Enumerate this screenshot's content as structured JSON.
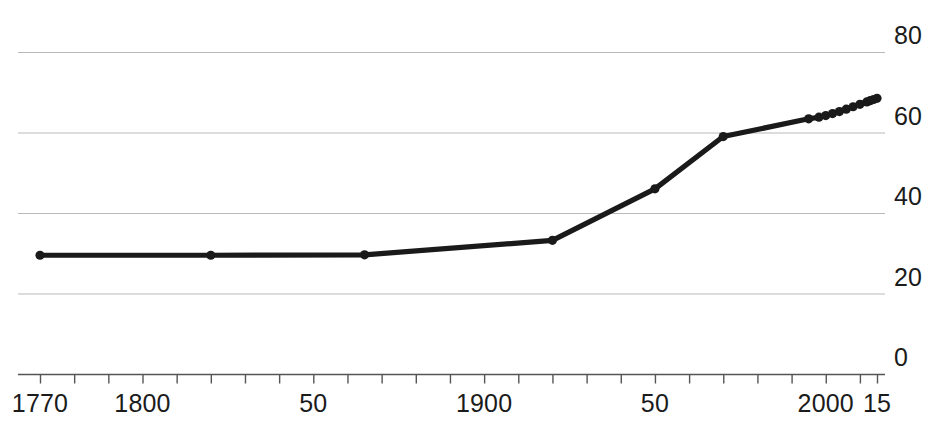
{
  "chart_data": {
    "type": "line",
    "title": "",
    "subtitle": "",
    "xlabel": "",
    "ylabel": "",
    "xlim": [
      1765,
      2019
    ],
    "ylim": [
      0,
      86
    ],
    "grid": true,
    "grid_axis": "y",
    "legend": "none",
    "y_axis_position": "right",
    "x_tick_interval_years": 10,
    "y_ticks": [
      {
        "value": 80,
        "label": "80"
      },
      {
        "value": 60,
        "label": "60"
      },
      {
        "value": 40,
        "label": "40"
      },
      {
        "value": 20,
        "label": "20"
      },
      {
        "value": 0,
        "label": "0"
      }
    ],
    "x_ticks": [
      {
        "value": 1770,
        "label": "1770"
      },
      {
        "value": 1800,
        "label": "1800"
      },
      {
        "value": 1850,
        "label": "50"
      },
      {
        "value": 1900,
        "label": "1900"
      },
      {
        "value": 1950,
        "label": "50"
      },
      {
        "value": 2000,
        "label": "2000"
      },
      {
        "value": 2015,
        "label": "15"
      }
    ],
    "series": [
      {
        "name": "series-1",
        "color": "#1a1a1a",
        "marker": "circle",
        "x": [
          1770,
          1820,
          1865,
          1920,
          1950,
          1970,
          1995,
          1998,
          2000,
          2002,
          2004,
          2006,
          2008,
          2010,
          2012,
          2013,
          2014,
          2015
        ],
        "values": [
          29.5,
          29.5,
          29.6,
          33.2,
          46.0,
          59.0,
          63.4,
          63.8,
          64.2,
          64.7,
          65.2,
          65.8,
          66.4,
          67.0,
          67.6,
          67.9,
          68.2,
          68.5
        ]
      }
    ]
  },
  "axis": {
    "baseline_color": "#555555",
    "grid_color": "#b9b9b9",
    "tick_color": "#555555",
    "label_color": "#1b1b1b"
  },
  "caption": {
    "remnant": ""
  }
}
